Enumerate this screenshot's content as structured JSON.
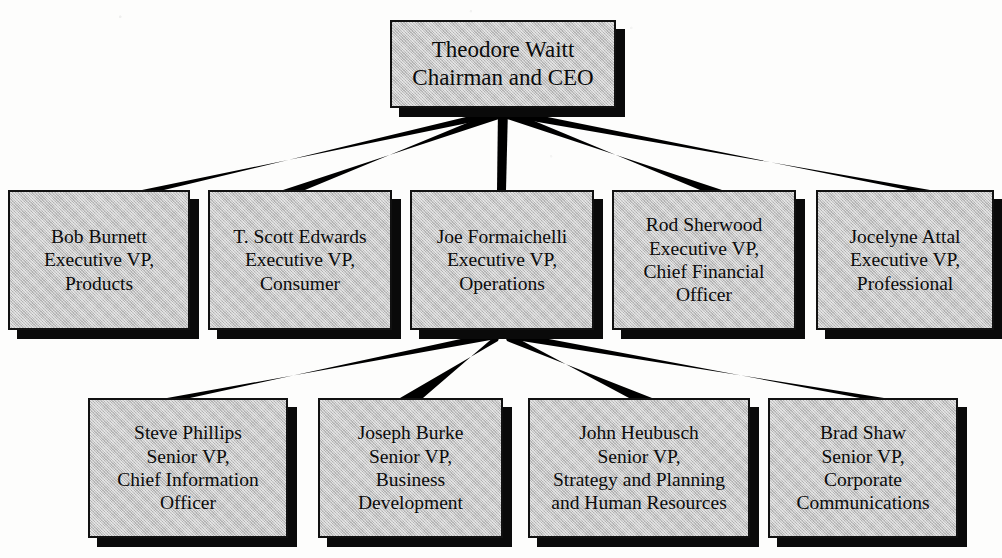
{
  "chart": {
    "type": "org-chart",
    "box_fill_color": "#c3c3c3",
    "box_border_color": "#111111",
    "shadow_color": "#0a0a0a",
    "connector_color": "#000000",
    "background_color": "#fdfdfc"
  },
  "levels": {
    "ceo": {
      "id": "ceo",
      "name": "Theodore Waitt",
      "title_line_1": "Chairman and CEO",
      "lines": [
        "Theodore Waitt",
        "Chairman and CEO"
      ]
    },
    "executives": [
      {
        "id": "burnett",
        "name": "Bob Burnett",
        "title_line_1": "Executive VP,",
        "title_line_2": "Products",
        "lines": [
          "Bob Burnett",
          "Executive VP,",
          "Products"
        ]
      },
      {
        "id": "edwards",
        "name": "T. Scott Edwards",
        "title_line_1": "Executive VP,",
        "title_line_2": "Consumer",
        "lines": [
          "T. Scott Edwards",
          "Executive VP,",
          "Consumer"
        ]
      },
      {
        "id": "formaichelli",
        "name": "Joe Formaichelli",
        "title_line_1": "Executive VP,",
        "title_line_2": "Operations",
        "lines": [
          "Joe Formaichelli",
          "Executive VP,",
          "Operations"
        ]
      },
      {
        "id": "sherwood",
        "name": "Rod Sherwood",
        "title_line_1": "Executive VP,",
        "title_line_2": "Chief Financial",
        "title_line_3": "Officer",
        "lines": [
          "Rod Sherwood",
          "Executive VP,",
          "Chief Financial",
          "Officer"
        ]
      },
      {
        "id": "attal",
        "name": "Jocelyne Attal",
        "title_line_1": "Executive VP,",
        "title_line_2": "Professional",
        "lines": [
          "Jocelyne Attal",
          "Executive VP,",
          "Professional"
        ]
      }
    ],
    "senior_vps": [
      {
        "id": "phillips",
        "name": "Steve Phillips",
        "title_line_1": "Senior VP,",
        "title_line_2": "Chief Information",
        "title_line_3": "Officer",
        "lines": [
          "Steve Phillips",
          "Senior VP,",
          "Chief Information",
          "Officer"
        ]
      },
      {
        "id": "burke",
        "name": "Joseph Burke",
        "title_line_1": "Senior VP,",
        "title_line_2": "Business",
        "title_line_3": "Development",
        "lines": [
          "Joseph Burke",
          "Senior VP,",
          "Business",
          "Development"
        ]
      },
      {
        "id": "heubusch",
        "name": "John Heubusch",
        "title_line_1": "Senior VP,",
        "title_line_2": "Strategy and Planning",
        "title_line_3": "and Human Resources",
        "lines": [
          "John Heubusch",
          "Senior VP,",
          "Strategy and Planning",
          "and Human Resources"
        ]
      },
      {
        "id": "shaw",
        "name": "Brad Shaw",
        "title_line_1": "Senior VP,",
        "title_line_2": "Corporate",
        "title_line_3": "Communications",
        "lines": [
          "Brad Shaw",
          "Senior VP,",
          "Corporate",
          "Communications"
        ]
      }
    ]
  },
  "connectors": {
    "ceo_fan_origin": {
      "x": 503,
      "y": 110
    },
    "ceo_targets": [
      {
        "to": "burnett",
        "x": 99,
        "y": 190
      },
      {
        "to": "edwards",
        "x": 300,
        "y": 190
      },
      {
        "to": "formaichelli",
        "x": 502,
        "y": 190
      },
      {
        "to": "sherwood",
        "x": 704,
        "y": 190
      },
      {
        "to": "attal",
        "x": 905,
        "y": 190
      }
    ],
    "operations_fan_origin": {
      "x": 502,
      "y": 332
    },
    "operations_targets": [
      {
        "to": "phillips",
        "x": 188,
        "y": 398
      },
      {
        "to": "burke",
        "x": 410,
        "y": 398
      },
      {
        "to": "heubusch",
        "x": 639,
        "y": 398
      },
      {
        "to": "shaw",
        "x": 863,
        "y": 398
      }
    ]
  }
}
